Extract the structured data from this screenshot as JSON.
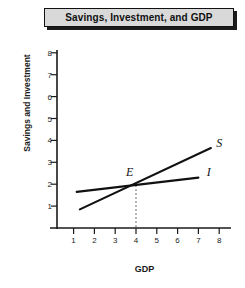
{
  "title": {
    "text": "Savings, Investment, and GDP"
  },
  "chart_data": {
    "type": "line",
    "title": "Savings, Investment, and GDP",
    "xlabel": "GDP",
    "ylabel": "Savings and Investment",
    "xlim": [
      0,
      8.7
    ],
    "ylim": [
      0,
      8.6
    ],
    "xticks": [
      "1",
      "2",
      "3",
      "4",
      "5",
      "6",
      "7",
      "8"
    ],
    "yticks": [
      "1",
      "2",
      "3",
      "4",
      "5",
      "6",
      "7",
      "8"
    ],
    "grid": false,
    "legend": "inline-curve-labels",
    "series": [
      {
        "name": "S",
        "label": "S",
        "description": "Savings curve, upward sloping",
        "x": [
          1.3,
          7.6
        ],
        "y": [
          0.85,
          3.65
        ],
        "label_x": 8.0,
        "label_y": 3.9,
        "color": "#111111"
      },
      {
        "name": "I",
        "label": "I",
        "description": "Investment curve, nearly flat upward sloping",
        "x": [
          1.15,
          7.0
        ],
        "y": [
          1.65,
          2.3
        ],
        "label_x": 7.5,
        "label_y": 2.55,
        "color": "#111111"
      }
    ],
    "annotations": [
      {
        "name": "equilibrium-point",
        "label": "E",
        "x": 4.0,
        "y": 2.0,
        "label_x": 3.7,
        "label_y": 2.55,
        "dropline": {
          "from_y": 1.95,
          "to_y": 0,
          "style": "dotted",
          "color": "#8a8a8a"
        }
      }
    ],
    "axis_color": "#1a1a1a",
    "background": "#ffffff"
  }
}
